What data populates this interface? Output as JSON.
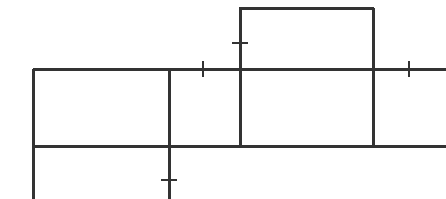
{
  "document": {
    "kind": "technical-line-drawing",
    "title": "",
    "background_color": "#ffffff",
    "stroke_color": "#333333",
    "canvas": {
      "width": 446,
      "height": 199
    }
  },
  "chart_data": {
    "type": "line",
    "title": "",
    "xlabel": "",
    "ylabel": "",
    "xlim": [
      0,
      446
    ],
    "ylim": [
      0,
      199
    ],
    "grid": false,
    "legend": null,
    "series": [
      {
        "name": "wall-upper-horizontal",
        "orientation": "horizontal",
        "x": [
          33,
          446
        ],
        "y": [
          69,
          69
        ],
        "width": 3
      },
      {
        "name": "wall-lower-horizontal",
        "orientation": "horizontal",
        "x": [
          33,
          446
        ],
        "y": [
          146,
          146
        ],
        "width": 3
      },
      {
        "name": "wall-top-of-raised-box",
        "orientation": "horizontal",
        "x": [
          239,
          374
        ],
        "y": [
          8,
          8
        ],
        "width": 3
      },
      {
        "name": "wall-left-vertical",
        "orientation": "vertical",
        "x": [
          33,
          33
        ],
        "y": [
          69,
          199
        ],
        "width": 3
      },
      {
        "name": "wall-middle-left-vertical",
        "orientation": "vertical",
        "x": [
          169,
          169
        ],
        "y": [
          69,
          199
        ],
        "width": 3
      },
      {
        "name": "wall-middle-right-vertical",
        "orientation": "vertical",
        "x": [
          240,
          240
        ],
        "y": [
          8,
          147
        ],
        "width": 3
      },
      {
        "name": "wall-right-vertical",
        "orientation": "vertical",
        "x": [
          373,
          373
        ],
        "y": [
          8,
          147
        ],
        "width": 3
      }
    ],
    "ticks": [
      {
        "name": "tick-on-raised-box-left-wall",
        "orientation": "horizontal",
        "cx": 240,
        "cy": 43,
        "length": 16,
        "width": 1.6
      },
      {
        "name": "tick-on-upper-wall-left",
        "orientation": "vertical",
        "cx": 203,
        "cy": 69,
        "length": 16,
        "width": 1.6
      },
      {
        "name": "tick-on-upper-wall-right",
        "orientation": "vertical",
        "cx": 409,
        "cy": 69,
        "length": 16,
        "width": 1.6
      },
      {
        "name": "tick-on-lower-left-wall",
        "orientation": "horizontal",
        "cx": 169,
        "cy": 180,
        "length": 16,
        "width": 1.6
      }
    ],
    "rooms": [
      {
        "name": "room-upper-left",
        "x": 33,
        "y": 69,
        "width": 136,
        "height": 77
      },
      {
        "name": "room-upper-mid",
        "x": 169,
        "y": 69,
        "width": 71,
        "height": 77
      },
      {
        "name": "room-center",
        "x": 240,
        "y": 69,
        "width": 133,
        "height": 77
      },
      {
        "name": "room-raised-top",
        "x": 240,
        "y": 8,
        "width": 133,
        "height": 61
      },
      {
        "name": "room-lower-left",
        "x": 33,
        "y": 146,
        "width": 136,
        "height": 53
      }
    ]
  }
}
